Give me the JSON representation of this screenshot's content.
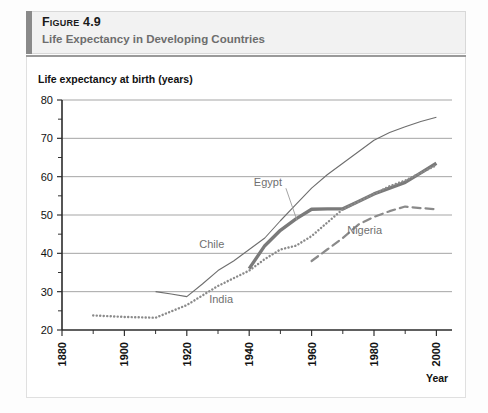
{
  "header": {
    "figure_number_word": "Figure",
    "figure_number": "4.9",
    "figure_label": "Figure 4.9",
    "title": "Life Expectancy in Developing Countries",
    "accent_color": "#8a8a8a",
    "band_color": "#f2f2f2"
  },
  "chart_data": {
    "type": "line",
    "title": "Life Expectancy in Developing Countries",
    "xlabel": "Year",
    "ylabel": "Life expectancy at birth (years)",
    "xlim": [
      1880,
      2005
    ],
    "ylim": [
      20,
      80
    ],
    "grid": "horizontal-major",
    "legend_position": "inline-labels",
    "x_ticks_major": [
      1880,
      1900,
      1920,
      1940,
      1960,
      1980,
      2000
    ],
    "x_ticks_minor": [
      1890,
      1910,
      1930,
      1950,
      1970,
      1990
    ],
    "y_ticks_major": [
      20,
      30,
      40,
      50,
      60,
      70,
      80
    ],
    "y_ticks_minor": [
      25,
      35,
      45,
      55,
      65,
      75
    ],
    "series": [
      {
        "name": "Chile",
        "style": "thin-solid",
        "color": "#6e6e6e",
        "label_x": 1928,
        "label_y": 41.5,
        "points": [
          [
            1910,
            30.0
          ],
          [
            1915,
            29.4
          ],
          [
            1920,
            28.7
          ],
          [
            1925,
            32.0
          ],
          [
            1930,
            35.5
          ],
          [
            1935,
            38.0
          ],
          [
            1940,
            41.0
          ],
          [
            1945,
            44.0
          ],
          [
            1950,
            48.5
          ],
          [
            1955,
            52.8
          ],
          [
            1960,
            57.0
          ],
          [
            1965,
            60.5
          ],
          [
            1970,
            63.5
          ],
          [
            1975,
            66.5
          ],
          [
            1980,
            69.5
          ],
          [
            1985,
            71.5
          ],
          [
            1990,
            73.0
          ],
          [
            1995,
            74.4
          ],
          [
            2000,
            75.5
          ]
        ]
      },
      {
        "name": "Egypt",
        "style": "thick-solid",
        "color": "#7a7a7a",
        "label_x": 1946,
        "label_y": 57.5,
        "points": [
          [
            1940,
            36.0
          ],
          [
            1945,
            42.0
          ],
          [
            1950,
            46.0
          ],
          [
            1955,
            49.0
          ],
          [
            1960,
            51.5
          ],
          [
            1965,
            51.6
          ],
          [
            1970,
            51.6
          ],
          [
            1975,
            53.5
          ],
          [
            1980,
            55.5
          ],
          [
            1985,
            57.0
          ],
          [
            1990,
            58.5
          ],
          [
            1995,
            61.0
          ],
          [
            2000,
            63.5
          ]
        ]
      },
      {
        "name": "India",
        "style": "dotted",
        "color": "#8a8a8a",
        "label_x": 1931,
        "label_y": 27.0,
        "points": [
          [
            1890,
            23.8
          ],
          [
            1900,
            23.4
          ],
          [
            1910,
            23.2
          ],
          [
            1920,
            26.5
          ],
          [
            1930,
            31.5
          ],
          [
            1940,
            35.5
          ],
          [
            1945,
            38.5
          ],
          [
            1950,
            41.0
          ],
          [
            1955,
            42.0
          ],
          [
            1960,
            44.5
          ],
          [
            1965,
            48.0
          ],
          [
            1970,
            51.5
          ],
          [
            1975,
            53.5
          ],
          [
            1980,
            55.5
          ],
          [
            1985,
            57.5
          ],
          [
            1990,
            59.0
          ],
          [
            1995,
            61.0
          ],
          [
            2000,
            63.0
          ]
        ]
      },
      {
        "name": "Nigeria",
        "style": "dashed",
        "color": "#8a8a8a",
        "label_x": 1977,
        "label_y": 45.0,
        "points": [
          [
            1960,
            38.0
          ],
          [
            1965,
            41.0
          ],
          [
            1970,
            44.0
          ],
          [
            1975,
            47.5
          ],
          [
            1980,
            49.5
          ],
          [
            1985,
            51.0
          ],
          [
            1990,
            52.2
          ],
          [
            1995,
            51.8
          ],
          [
            2000,
            51.5
          ]
        ]
      }
    ]
  }
}
